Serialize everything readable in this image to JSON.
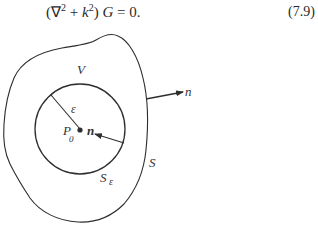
{
  "equation": {
    "open_paren": "(",
    "nabla": "∇",
    "nabla_exp": "2",
    "plus": " + ",
    "k": "k",
    "k_exp": "2",
    "close_paren": ")",
    "G": " G",
    "equals_zero": " = 0.",
    "number": "(7.9)"
  },
  "figure": {
    "labels": {
      "volume": "V",
      "outer_surface": "S",
      "inner_surface": "S",
      "inner_surface_sub": "ε",
      "radius": "ε",
      "point": "P",
      "point_sub": "0",
      "outer_normal": "n",
      "inner_normal": "n"
    },
    "colors": {
      "stroke": "#2e2e2e",
      "background": "#ffffff"
    }
  }
}
